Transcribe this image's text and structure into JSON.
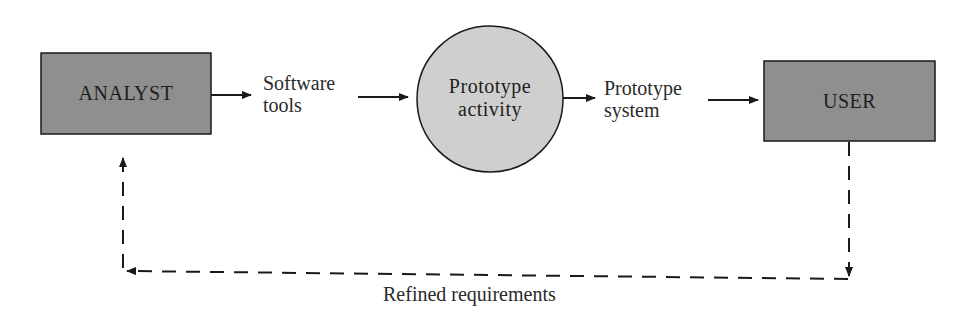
{
  "diagram": {
    "nodes": [
      {
        "id": "analyst",
        "label": "ANALYST",
        "shape": "rectangle",
        "fill": "#8f8f8f"
      },
      {
        "id": "prototype_activity",
        "label_lines": [
          "Prototype",
          "activity"
        ],
        "shape": "circle",
        "fill": "#cfcfcf"
      },
      {
        "id": "user",
        "label": "USER",
        "shape": "rectangle",
        "fill": "#8f8f8f"
      }
    ],
    "flows": [
      {
        "from": "analyst",
        "to": "prototype_activity",
        "label_lines": [
          "Software",
          "tools"
        ],
        "style": "solid"
      },
      {
        "from": "prototype_activity",
        "to": "user",
        "label_lines": [
          "Prototype",
          "system"
        ],
        "style": "solid"
      },
      {
        "from": "user",
        "to": "analyst",
        "label": "Refined requirements",
        "style": "dashed"
      }
    ],
    "colors": {
      "box_fill": "#8f8f8f",
      "circle_fill": "#cfcfcf",
      "stroke": "#1a1a1a"
    }
  }
}
